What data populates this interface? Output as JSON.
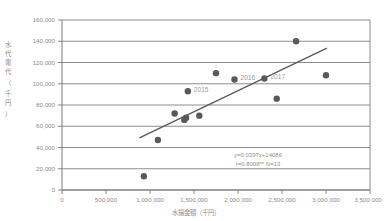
{
  "chart_data": {
    "type": "scatter",
    "title": "",
    "xlabel": "水揚金額（千円）",
    "ylabel": "水代電代（千円）",
    "xlim": [
      0,
      3500000
    ],
    "ylim": [
      0,
      160000
    ],
    "grid": true,
    "legend_position": "none",
    "x_ticks": [
      "0",
      "500,000",
      "1,000,000",
      "1,500,000",
      "2,000,000",
      "2,500,000",
      "3,000,000",
      "3,500,000"
    ],
    "x_tick_values": [
      0,
      500000,
      1000000,
      1500000,
      2000000,
      2500000,
      3000000,
      3500000
    ],
    "y_ticks": [
      "0",
      "20,000",
      "40,000",
      "60,000",
      "80,000",
      "100,000",
      "120,000",
      "140,000",
      "160,000"
    ],
    "y_tick_values": [
      0,
      20000,
      40000,
      60000,
      80000,
      100000,
      120000,
      140000,
      160000
    ],
    "series": [
      {
        "name": "observations",
        "marker": "circle",
        "color": "#595959",
        "points": [
          {
            "x": 930000,
            "y": 13000,
            "label": ""
          },
          {
            "x": 1090000,
            "y": 47000,
            "label": ""
          },
          {
            "x": 1280000,
            "y": 72000,
            "label": ""
          },
          {
            "x": 1390000,
            "y": 66000,
            "label": ""
          },
          {
            "x": 1410000,
            "y": 68000,
            "label": ""
          },
          {
            "x": 1430000,
            "y": 93000,
            "label": "2015"
          },
          {
            "x": 1560000,
            "y": 70000,
            "label": ""
          },
          {
            "x": 1750000,
            "y": 110000,
            "label": ""
          },
          {
            "x": 1960000,
            "y": 104000,
            "label": "2016"
          },
          {
            "x": 2300000,
            "y": 105000,
            "label": "2017"
          },
          {
            "x": 2440000,
            "y": 86000,
            "label": ""
          },
          {
            "x": 2660000,
            "y": 140000,
            "label": ""
          },
          {
            "x": 3000000,
            "y": 108000,
            "label": ""
          }
        ]
      }
    ],
    "trendline": {
      "equation": "y=0.0397x+14086",
      "slope": 0.0397,
      "intercept": 14086,
      "x_start": 880000,
      "x_end": 3010000,
      "color": "#595959"
    },
    "annotations": [
      {
        "name": "regression-equation",
        "text": "y=0.0397x+14086"
      },
      {
        "name": "correlation-stats",
        "text": "r=0.8008** N=13"
      }
    ]
  },
  "labels": {
    "equation": "y=0.0397x+14086",
    "stats": "r=0.8008** N=13",
    "point_2015": "2015",
    "point_2016": "2016",
    "point_2017": "2017",
    "x_axis_title": "水揚金額（千円）",
    "y_axis_title": "水代電代（千円）",
    "y_axis_chars": [
      "水",
      "代",
      "電",
      "代",
      "（",
      "千",
      "円",
      "）"
    ]
  }
}
